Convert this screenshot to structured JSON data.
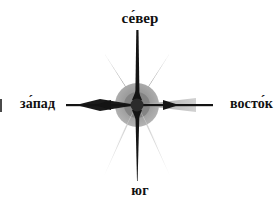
{
  "figure": {
    "background_color": "#ffffff"
  },
  "labels": {
    "north": "се́вер",
    "south": "юг",
    "west": "за́пад",
    "east": "восто́к"
  },
  "compass": {
    "center_x": 137,
    "center_y": 105,
    "hub_radius": 22,
    "colors": {
      "axis_dark": "#141414",
      "ray_upper": "#6b6b6b",
      "ray_lower": "#d8d8d8",
      "ray_east": "#b9b9b9",
      "hub_outer": "#9a9a9a",
      "hub_inner": "#7d7d7d",
      "hub_core": "#2b2b2b"
    },
    "points": [
      {
        "name": "north-ray",
        "direction": "N",
        "tone": "dark"
      },
      {
        "name": "south-ray",
        "direction": "S",
        "tone": "dark"
      },
      {
        "name": "west-ray",
        "direction": "W",
        "tone": "dark"
      },
      {
        "name": "east-ray",
        "direction": "E",
        "tone": "light"
      },
      {
        "name": "northwest-ray",
        "direction": "NW",
        "tone": "mid"
      },
      {
        "name": "northeast-ray",
        "direction": "NE",
        "tone": "mid"
      },
      {
        "name": "southwest-ray",
        "direction": "SW",
        "tone": "pale"
      },
      {
        "name": "southeast-ray",
        "direction": "SE",
        "tone": "pale"
      }
    ]
  }
}
